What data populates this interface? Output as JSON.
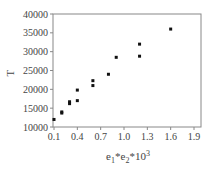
{
  "chart_data": {
    "type": "scatter",
    "title": "",
    "xlabel": "e1*e2*10^3",
    "xlabel_parts": {
      "base1": "e",
      "sub1": "1",
      "op1": "*",
      "base2": "e",
      "sub2": "2",
      "op2": "*10",
      "sup": "3"
    },
    "ylabel": "T",
    "xlim": [
      0.1,
      2.0
    ],
    "ylim": [
      10000,
      40000
    ],
    "xticks": [
      0.1,
      0.4,
      0.7,
      1.0,
      1.3,
      1.6,
      1.9
    ],
    "xtick_labels": [
      "0.1",
      "0.4",
      "0.7",
      "1.0",
      "1.3",
      "1.6",
      "1.9"
    ],
    "yticks": [
      10000,
      15000,
      20000,
      25000,
      30000,
      35000,
      40000
    ],
    "ytick_labels": [
      "10000",
      "15000",
      "20000",
      "25000",
      "30000",
      "35000",
      "40000"
    ],
    "grid": false,
    "legend": null,
    "series": [
      {
        "name": "T",
        "marker": "square",
        "color": "#111111",
        "points": [
          {
            "x": 0.1,
            "y": 12000
          },
          {
            "x": 0.2,
            "y": 13700
          },
          {
            "x": 0.2,
            "y": 14000
          },
          {
            "x": 0.3,
            "y": 16200
          },
          {
            "x": 0.3,
            "y": 16700
          },
          {
            "x": 0.4,
            "y": 17000
          },
          {
            "x": 0.4,
            "y": 19800
          },
          {
            "x": 0.6,
            "y": 21000
          },
          {
            "x": 0.6,
            "y": 22300
          },
          {
            "x": 0.8,
            "y": 24000
          },
          {
            "x": 0.9,
            "y": 28500
          },
          {
            "x": 1.2,
            "y": 28800
          },
          {
            "x": 1.2,
            "y": 32000
          },
          {
            "x": 1.6,
            "y": 36000
          }
        ]
      }
    ]
  },
  "colors": {
    "axis": "#888888",
    "marker": "#111111",
    "text": "#444444"
  }
}
